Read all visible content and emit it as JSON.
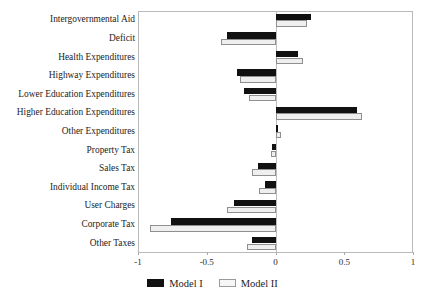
{
  "chart_data": {
    "type": "bar",
    "orientation": "horizontal",
    "title": "",
    "xlabel": "",
    "ylabel": "",
    "xlim": [
      -1,
      1
    ],
    "xticks": [
      -1,
      -0.5,
      0,
      0.5,
      1
    ],
    "xtick_labels": [
      "-1",
      "-0.5",
      "0",
      "0.5",
      "1"
    ],
    "grid": false,
    "legend_position": "bottom-center",
    "categories": [
      "Intergovernmental Aid",
      "Deficit",
      "Health Expenditures",
      "Highway Expenditures",
      "Lower Education Expenditures",
      "Higher Education Expenditures",
      "Other Expenditures",
      "Property Tax",
      "Sales Tax",
      "Individual Income Tax",
      "User Charges",
      "Corporate Tax",
      "Other Taxes"
    ],
    "series": [
      {
        "name": "Model I",
        "color": "#111111",
        "values": [
          0.26,
          -0.35,
          0.16,
          -0.28,
          -0.23,
          0.59,
          0.015,
          -0.025,
          -0.13,
          -0.08,
          -0.3,
          -0.76,
          -0.17
        ]
      },
      {
        "name": "Model II",
        "color": "#efefef",
        "values": [
          0.23,
          -0.4,
          0.2,
          -0.26,
          -0.19,
          0.63,
          0.04,
          -0.035,
          -0.17,
          -0.12,
          -0.35,
          -0.91,
          -0.21
        ]
      }
    ]
  },
  "legend": {
    "items": [
      {
        "label": "Model I",
        "swatch": "black-filled-swatch"
      },
      {
        "label": "Model II",
        "swatch": "white-outlined-swatch"
      }
    ]
  }
}
